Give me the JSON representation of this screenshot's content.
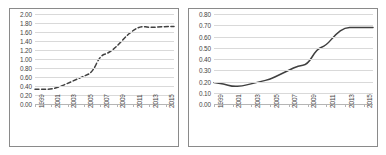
{
  "figure": {
    "background_color": "#ffffff",
    "frame_color": "#8a8a8a",
    "gridline_color": "#d9d9d9",
    "axis_color": "#b5b5b5",
    "label_color": "#3f3f3f"
  },
  "chart_data": [
    {
      "id": "left",
      "type": "line",
      "title": "",
      "subtitle": "",
      "xlabel": "",
      "ylabel": "",
      "grid": true,
      "legend": false,
      "line_style": "dashed",
      "line_color": "#404040",
      "xlim": [
        1999,
        2016
      ],
      "ylim": [
        0.0,
        2.0
      ],
      "ytick_labels": [
        "2.00",
        "1.80",
        "1.60",
        "1.40",
        "1.20",
        "1.00",
        "0.80",
        "0.60",
        "0.40",
        "0.20",
        "0.00"
      ],
      "ytick_values": [
        2.0,
        1.8,
        1.6,
        1.4,
        1.2,
        1.0,
        0.8,
        0.6,
        0.4,
        0.2,
        0.0
      ],
      "xtick_labels": [
        "1999",
        "2001",
        "2003",
        "2005",
        "2007",
        "2009",
        "2011",
        "2013",
        "2015"
      ],
      "xtick_values": [
        1999,
        2001,
        2003,
        2005,
        2007,
        2009,
        2011,
        2013,
        2015
      ],
      "x": [
        1999,
        2000,
        2001,
        2002,
        2003,
        2004,
        2005,
        2006,
        2007,
        2008,
        2009,
        2010,
        2011,
        2012,
        2013,
        2014,
        2015,
        2016
      ],
      "values": [
        0.33,
        0.33,
        0.33,
        0.38,
        0.46,
        0.54,
        0.62,
        0.7,
        1.08,
        1.13,
        1.28,
        1.48,
        1.64,
        1.73,
        1.7,
        1.71,
        1.72,
        1.72
      ]
    },
    {
      "id": "right",
      "type": "line",
      "title": "",
      "subtitle": "",
      "xlabel": "",
      "ylabel": "",
      "grid": true,
      "legend": false,
      "line_style": "solid",
      "line_color": "#404040",
      "xlim": [
        1999,
        2016
      ],
      "ylim": [
        0.0,
        0.8
      ],
      "ytick_labels": [
        "0.80",
        "0.70",
        "0.60",
        "0.50",
        "0.40",
        "0.30",
        "0.20",
        "0.10",
        "0.00"
      ],
      "ytick_values": [
        0.8,
        0.7,
        0.6,
        0.5,
        0.4,
        0.3,
        0.2,
        0.1,
        0.0
      ],
      "xtick_labels": [
        "1999",
        "2001",
        "2003",
        "2005",
        "2007",
        "2009",
        "2011",
        "2013",
        "2015"
      ],
      "xtick_values": [
        1999,
        2001,
        2003,
        2005,
        2007,
        2009,
        2011,
        2013,
        2015
      ],
      "x": [
        1999,
        2000,
        2001,
        2002,
        2003,
        2004,
        2005,
        2006,
        2007,
        2008,
        2009,
        2010,
        2011,
        2012,
        2013,
        2014,
        2015,
        2016
      ],
      "values": [
        0.19,
        0.18,
        0.155,
        0.16,
        0.18,
        0.2,
        0.22,
        0.26,
        0.3,
        0.34,
        0.35,
        0.49,
        0.52,
        0.62,
        0.68,
        0.68,
        0.68,
        0.68
      ]
    }
  ]
}
